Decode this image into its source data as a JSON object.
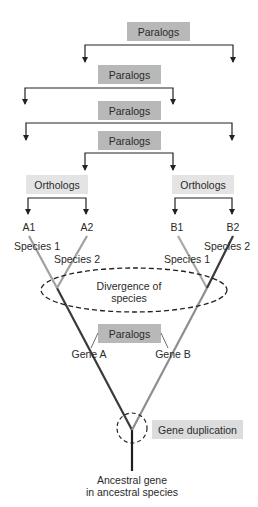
{
  "diagram": {
    "paralog_brackets": [
      {
        "label": "Paralogs"
      },
      {
        "label": "Paralogs"
      },
      {
        "label": "Paralogs"
      },
      {
        "label": "Paralogs"
      }
    ],
    "ortholog_groups": [
      {
        "label": "Orthologs"
      },
      {
        "label": "Orthologs"
      }
    ],
    "leaves": [
      {
        "id": "A1",
        "species": "Species 1"
      },
      {
        "id": "A2",
        "species": "Species 2"
      },
      {
        "id": "B1",
        "species": "Species 1"
      },
      {
        "id": "B2",
        "species": "Species 2"
      }
    ],
    "divergence_label_line1": "Divergence of",
    "divergence_label_line2": "species",
    "inner_paralogs_label": "Paralogs",
    "gene_a_label": "Gene A",
    "gene_b_label": "Gene B",
    "duplication_label": "Gene duplication",
    "ancestral_label_line1": "Ancestral gene",
    "ancestral_label_line2": "in ancestral species",
    "colors": {
      "paralog_box": "#b8b8b8",
      "ortholog_box": "#e4e4e4",
      "duplication_box": "#dcdcdc",
      "dark_branch": "#3a3a3a",
      "light_branch": "#a0a0a0",
      "mid_branch": "#7a7a7a",
      "bracket": "#222222"
    }
  }
}
